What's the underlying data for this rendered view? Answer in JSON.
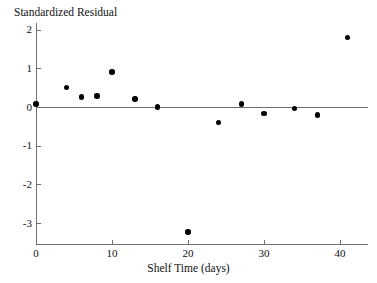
{
  "chart_data": {
    "type": "scatter",
    "title": "",
    "xlabel": "Shelf Time (days)",
    "ylabel": "Standardized Residual",
    "xlim": [
      -2,
      45.6
    ],
    "ylim": [
      -3.55,
      2.22
    ],
    "xticks": [
      0,
      10,
      20,
      30,
      40
    ],
    "xtick_labels": [
      "0",
      "10",
      "20",
      "30",
      "40"
    ],
    "yticks": [
      2,
      1,
      0,
      -1,
      -2,
      -3
    ],
    "ytick_labels": [
      "2",
      "1",
      "0",
      "-1",
      "-2",
      "-3"
    ],
    "grid": false,
    "legend": null,
    "reference_line": {
      "y": 0,
      "style": "solid",
      "color": "#6f6f6f"
    },
    "points": [
      {
        "x": 0,
        "y": 0.08
      },
      {
        "x": 4,
        "y": 0.5
      },
      {
        "x": 6,
        "y": 0.26
      },
      {
        "x": 8,
        "y": 0.29
      },
      {
        "x": 10,
        "y": 0.91
      },
      {
        "x": 13,
        "y": 0.21
      },
      {
        "x": 16,
        "y": 0.0
      },
      {
        "x": 20,
        "y": -3.23
      },
      {
        "x": 24,
        "y": -0.4
      },
      {
        "x": 27,
        "y": 0.08
      },
      {
        "x": 30,
        "y": -0.16
      },
      {
        "x": 34,
        "y": -0.03
      },
      {
        "x": 37,
        "y": -0.21
      },
      {
        "x": 41,
        "y": 1.8
      }
    ]
  },
  "colors": {
    "marker": "#000000",
    "axis": "#6f6f6f",
    "text": "#111111",
    "background": "#ffffff"
  }
}
